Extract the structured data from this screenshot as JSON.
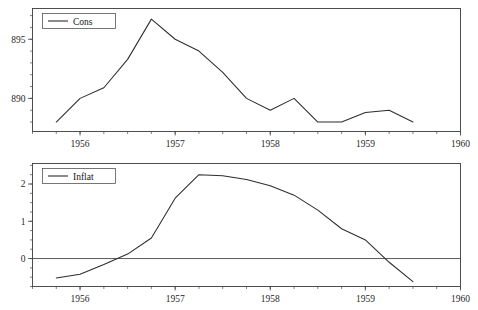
{
  "figure": {
    "title": "",
    "background": "#ffffff",
    "line_color": "#2d2d2d",
    "axis_color": "#3c3c3c",
    "panels": 2
  },
  "chart_data": [
    {
      "type": "line",
      "title": "",
      "panel_name": "Cons",
      "xlabel": "",
      "ylabel": "",
      "grid": false,
      "legend": "Cons",
      "legend_position": "top-left",
      "xlim": [
        1955.5,
        1960.0
      ],
      "ylim": [
        887.2,
        897.6
      ],
      "xticks": [
        1956,
        1957,
        1958,
        1959,
        1960
      ],
      "xticklabels": [
        "1956",
        "1957",
        "1958",
        "1959",
        "1960"
      ],
      "yticks": [
        890,
        895
      ],
      "yticklabels": [
        "890",
        "895"
      ],
      "yminor_step": 1,
      "series": [
        {
          "name": "Cons",
          "x": [
            1955.75,
            1956.0,
            1956.25,
            1956.5,
            1956.75,
            1957.0,
            1957.25,
            1957.5,
            1957.75,
            1958.0,
            1958.25,
            1958.5,
            1958.75,
            1959.0,
            1959.25,
            1959.5
          ],
          "values": [
            888.0,
            890.0,
            890.9,
            893.3,
            896.7,
            895.0,
            894.0,
            892.2,
            890.0,
            889.0,
            890.0,
            888.0,
            888.0,
            888.8,
            889.0,
            888.0
          ]
        }
      ]
    },
    {
      "type": "line",
      "title": "",
      "panel_name": "Inflat",
      "xlabel": "",
      "ylabel": "",
      "grid": false,
      "legend": "Inflat",
      "legend_position": "top-left",
      "xlim": [
        1955.5,
        1960.0
      ],
      "ylim": [
        -0.75,
        2.55
      ],
      "xticks": [
        1956,
        1957,
        1958,
        1959,
        1960
      ],
      "xticklabels": [
        "1956",
        "1957",
        "1958",
        "1959",
        "1960"
      ],
      "yticks": [
        0,
        1,
        2
      ],
      "yticklabels": [
        "0",
        "1",
        "2"
      ],
      "yminor_step": 0.25,
      "zero_line": 0,
      "series": [
        {
          "name": "Inflat",
          "x": [
            1955.75,
            1956.0,
            1956.25,
            1956.5,
            1956.75,
            1957.0,
            1957.25,
            1957.5,
            1957.75,
            1958.0,
            1958.25,
            1958.5,
            1958.75,
            1959.0,
            1959.25,
            1959.5
          ],
          "values": [
            -0.52,
            -0.42,
            -0.16,
            0.12,
            0.55,
            1.62,
            2.25,
            2.22,
            2.12,
            1.95,
            1.7,
            1.3,
            0.8,
            0.5,
            -0.1,
            -0.62
          ]
        }
      ]
    }
  ]
}
